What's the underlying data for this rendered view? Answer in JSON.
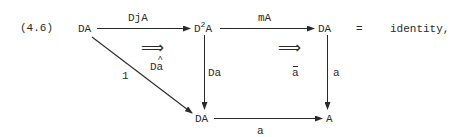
{
  "equation_number": "(4.6)",
  "nodes": {
    "top_left": "DA",
    "top_mid_base": "D",
    "top_mid_sup": "2",
    "top_mid_rest": "A",
    "top_right": "DA",
    "bottom_mid": "DA",
    "bottom_right": "A"
  },
  "arrows": {
    "top_left_to_mid": "DjA",
    "top_mid_to_right": "mA",
    "diagonal": "1",
    "mid_vertical": "Da",
    "right_vertical": "a",
    "bottom": "a"
  },
  "two_cells": {
    "left_symbol": "⟹",
    "left_label_base": "D",
    "left_label_hat": "a",
    "right_symbol": "⟹",
    "right_label_bar": "a"
  },
  "equals": "=",
  "result": "identity,",
  "colors": {
    "ink": "#2a2a2a",
    "background": "#ffffff"
  }
}
